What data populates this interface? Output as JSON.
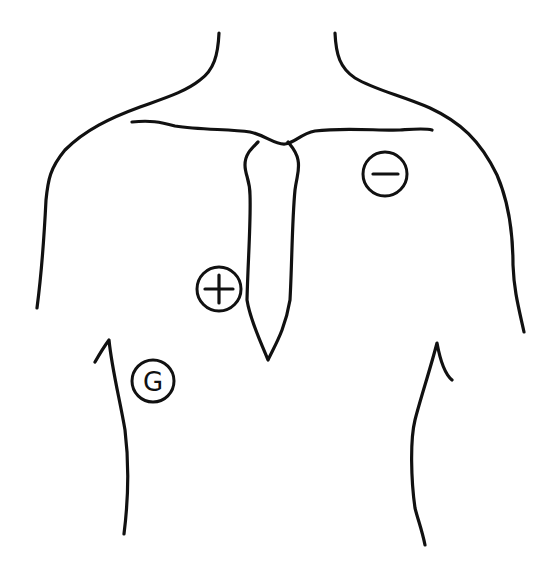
{
  "colors": {
    "line": "#111111",
    "background": "#ffffff"
  },
  "electrodes": [
    {
      "id": "negative",
      "symbol": "minus",
      "label": "",
      "location": "left upper chest, below clavicle"
    },
    {
      "id": "positive",
      "symbol": "plus",
      "label": "",
      "location": "right chest, beside sternum"
    },
    {
      "id": "ground",
      "symbol": "G",
      "label": "G",
      "location": "right lower chest"
    }
  ]
}
